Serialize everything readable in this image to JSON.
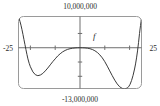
{
  "figure": {
    "function_label": "f",
    "window": {
      "xmin_label": "-25",
      "xmax_label": "25",
      "ymax_label": "10,000,000",
      "ymin_label": "-13,000,000"
    },
    "colors": {
      "curve": "#3a3a3a",
      "axis": "#6e6e6e",
      "frame": "#9a9a9a",
      "text": "#2b2b2b",
      "background": "#ffffff"
    }
  },
  "chart_data": {
    "type": "line",
    "title": "",
    "subtitle": "",
    "xlabel": "",
    "ylabel": "",
    "xlim": [
      -25,
      25
    ],
    "ylim": [
      -13000000,
      10000000
    ],
    "grid": false,
    "legend": "none",
    "annotations": [
      {
        "text": "f",
        "x": 6.0,
        "y": 3600000,
        "style": "italic"
      },
      {
        "text": "10,000,000",
        "x": 0,
        "y": 10000000,
        "position": "above-frame-center"
      },
      {
        "text": "-13,000,000",
        "x": 0,
        "y": -13000000,
        "position": "below-frame-center"
      },
      {
        "text": "-25",
        "x": -25,
        "y": 0,
        "position": "left-of-frame"
      },
      {
        "text": "25",
        "x": 25,
        "y": 0,
        "position": "right-of-frame"
      }
    ],
    "axes": {
      "x_axis_at_y": 0,
      "y_axis_at_x": 0,
      "x_ticks": [
        -20,
        -10,
        0,
        10,
        20
      ],
      "y_ticks": [
        -9000000,
        -4500000,
        0,
        4500000
      ],
      "x_tick_labels": [
        "",
        "",
        "",
        "",
        ""
      ],
      "y_tick_labels": [
        "",
        "",
        "",
        ""
      ]
    },
    "series": [
      {
        "name": "f",
        "comment": "even-symmetry-broken high-degree polynomial; flat near origin, two deep minima, steep edges",
        "x": [
          -25.0,
          -24.6,
          -24.2,
          -23.8,
          -23.4,
          -23.0,
          -22.6,
          -22.2,
          -21.8,
          -21.4,
          -21.0,
          -20.5,
          -20.0,
          -19.0,
          -18.0,
          -17.0,
          -16.0,
          -15.0,
          -14.0,
          -13.0,
          -12.0,
          -11.0,
          -10.0,
          -9.0,
          -8.0,
          -7.0,
          -6.0,
          -5.0,
          -4.0,
          -3.0,
          -2.0,
          -1.0,
          0.0,
          1.0,
          2.0,
          3.0,
          4.0,
          5.0,
          6.0,
          7.0,
          8.0,
          9.0,
          10.0,
          11.0,
          12.0,
          13.0,
          14.0,
          15.0,
          16.0,
          17.0,
          18.0,
          19.0,
          19.6,
          20.2,
          20.8,
          21.4,
          22.0,
          22.4,
          22.8,
          23.2,
          23.6,
          24.0,
          24.4,
          24.8,
          25.0
        ],
        "y": [
          10000000,
          9300000,
          8300000,
          7100000,
          5700000,
          4200000,
          2600000,
          1000000,
          -600000,
          -2100000,
          -3500000,
          -4900000,
          -6000000,
          -7600000,
          -8500000,
          -8800000,
          -8600000,
          -8100000,
          -7300000,
          -6400000,
          -5400000,
          -4400000,
          -3500000,
          -2600000,
          -1900000,
          -1300000,
          -850000,
          -520000,
          -300000,
          -150000,
          -60000,
          -10000,
          0,
          -10000,
          -50000,
          -140000,
          -300000,
          -560000,
          -950000,
          -1500000,
          -2250000,
          -3200000,
          -4400000,
          -5800000,
          -7300000,
          -8800000,
          -10200000,
          -11400000,
          -12300000,
          -12800000,
          -13000000,
          -12700000,
          -12300000,
          -11500000,
          -10300000,
          -8700000,
          -6700000,
          -5100000,
          -3200000,
          -1000000,
          1600000,
          4500000,
          7000000,
          9200000,
          10000000
        ]
      }
    ]
  }
}
